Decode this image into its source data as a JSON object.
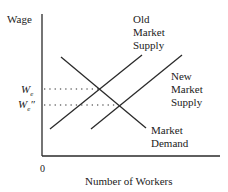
{
  "diagram": {
    "y_axis_label": "Wage",
    "x_axis_label": "Number of Workers",
    "origin_label": "0",
    "wage_levels": [
      {
        "label": "W",
        "sub": "e",
        "sup": ""
      },
      {
        "label": "W",
        "sub": "e",
        "sup": "″"
      }
    ],
    "curves": [
      {
        "name": "Old Market Supply",
        "lines": [
          "Old",
          "Market",
          "Supply"
        ]
      },
      {
        "name": "New Market Supply",
        "lines": [
          "New",
          "Market",
          "Supply"
        ]
      },
      {
        "name": "Market Demand",
        "lines": [
          "Market",
          "Demand"
        ]
      }
    ],
    "colors": {
      "line": "#2a2a2a",
      "text": "#222222",
      "background": "#ffffff"
    }
  }
}
